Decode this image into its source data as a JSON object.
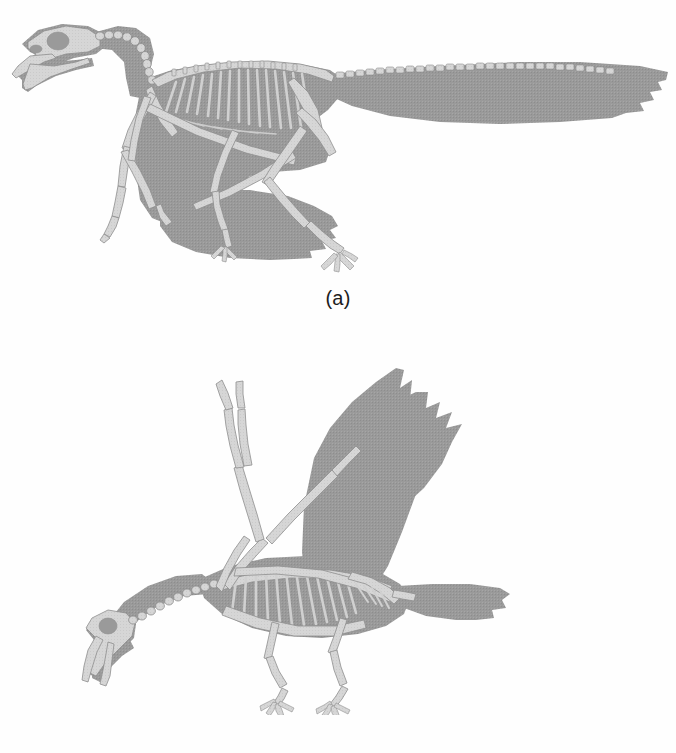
{
  "figure": {
    "background_color": "#fefefe",
    "body_fill_color": "#9a9a9a",
    "bone_fill_color": "#d6d6d6",
    "bone_outline_color": "#8e8e8e",
    "caption_color": "#1d1d1d",
    "panels": [
      {
        "id": "a",
        "caption": "(a)",
        "subject": "archaeopteryx-skeleton",
        "description": "Feathered dinosaur-bird skeleton in lateral view with long bony tail, clawed forelimbs and toothed jaws",
        "orientation": "facing-left",
        "tail_type": "long-bony-tail",
        "wing_position": "folded-lowered",
        "anatomy": [
          "skull-with-eye-socket",
          "toothed-jaw",
          "cervical-vertebrae",
          "dorsal-vertebrae",
          "rib-cage",
          "pectoral-girdle",
          "forelimb-with-claws",
          "pelvis",
          "hindlimb",
          "clawed-foot",
          "caudal-vertebrae",
          "tail-feathers",
          "wing-feathers"
        ]
      },
      {
        "id": "b",
        "caption": "(b)",
        "subject": "modern-bird-skeleton",
        "description": "Modern bird skeleton in lateral view with raised wings, fused short tail fan and clawless wing digits",
        "orientation": "facing-left",
        "tail_type": "short-fan-tail",
        "wing_position": "raised-upstroke",
        "anatomy": [
          "skull-with-eye-socket",
          "beak",
          "cervical-vertebrae",
          "sternum-keel",
          "rib-cage",
          "humerus",
          "radius-ulna",
          "carpometacarpus",
          "pelvis",
          "femur",
          "tibiotarsus",
          "tarsometatarsus",
          "clawed-foot",
          "pygostyle",
          "tail-feathers",
          "wing-feathers"
        ]
      }
    ]
  }
}
